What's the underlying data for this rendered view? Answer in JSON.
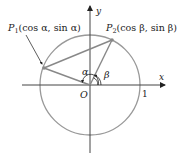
{
  "diagram": {
    "axes": {
      "x_label": "x",
      "y_label": "y",
      "origin_label": "O",
      "unit_tick_label": "1"
    },
    "points": [
      {
        "id": "P1",
        "name": "P",
        "sub": "1",
        "coords": "(cos α, sin α)",
        "angle_label": "α"
      },
      {
        "id": "P2",
        "name": "P",
        "sub": "2",
        "coords": "(cos β, sin β)",
        "angle_label": "β"
      }
    ],
    "colors": {
      "circle": "#999999",
      "segments": "#888888",
      "axes": "#333333",
      "text": "#222222"
    }
  }
}
